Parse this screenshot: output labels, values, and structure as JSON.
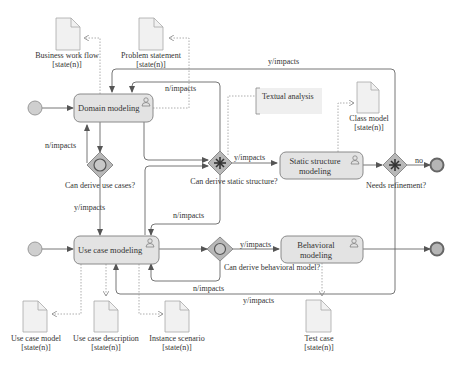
{
  "diagram": {
    "tasks": {
      "domain_modeling": "Domain modeling",
      "use_case_modeling": "Use case modeling",
      "static_structure_1": "Static structure",
      "static_structure_2": "modeling",
      "behavioral_1": "Behavioral",
      "behavioral_2": "modeling"
    },
    "gateways": {
      "use_cases": "Can derive use cases?",
      "static_structure": "Can derive static structure?",
      "behavioral_model": "Can derive behavioral model?",
      "refinement": "Needs refinement?"
    },
    "documents": {
      "business_work_flow": {
        "name": "Business work flow",
        "state": "[state(n)]"
      },
      "problem_statement": {
        "name": "Problem statement",
        "state": "[state(n)]"
      },
      "class_model": {
        "name": "Class model",
        "state": "[state(n)]"
      },
      "use_case_model": {
        "name": "Use case model",
        "state": "[state(n)]"
      },
      "use_case_description": {
        "name": "Use case description",
        "state": "[state(n)]"
      },
      "instance_scenario": {
        "name": "Instance scenario",
        "state": "[state(n)]"
      },
      "test_case": {
        "name": "Test case",
        "state": "[state(n)]"
      }
    },
    "annotation": "Textual analysis",
    "flow_labels": {
      "top_y_impacts": "y/impacts",
      "top_n_impacts": "n/impacts",
      "left_n_impacts": "n/impacts",
      "left_y_impacts": "y/impacts",
      "static_y_impacts": "y/impacts",
      "mid_n_impacts": "n/impacts",
      "no": "no",
      "behav_y_impacts": "y/impacts",
      "bottom_n_impacts": "n/impacts",
      "bottom_y_impacts": "y/impacts"
    }
  }
}
